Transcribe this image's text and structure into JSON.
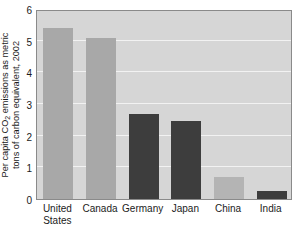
{
  "chart_data": {
    "type": "bar",
    "title": "",
    "xlabel": "",
    "ylabel_line1": "Per capita CO",
    "ylabel_sub": "2",
    "ylabel_line1b": " emissions as metric",
    "ylabel_line2": "tons of carbon equivalent, 2002",
    "categories": [
      "United States",
      "Canada",
      "Germany",
      "Japan",
      "China",
      "India"
    ],
    "category_lines": [
      [
        "United",
        "States"
      ],
      [
        "Canada"
      ],
      [
        "Germany"
      ],
      [
        "Japan"
      ],
      [
        "China"
      ],
      [
        "India"
      ]
    ],
    "values": [
      5.4,
      5.1,
      2.7,
      2.45,
      0.7,
      0.25
    ],
    "bar_colors": [
      "#a8a8a8",
      "#a8a8a8",
      "#3d3d3d",
      "#3d3d3d",
      "#b4b4b4",
      "#3d3d3d"
    ],
    "ylim": [
      0,
      6
    ],
    "ytick_labels": [
      "0",
      "1",
      "2",
      "3",
      "4",
      "5",
      "6"
    ],
    "ytick_values": [
      0,
      1,
      2,
      3,
      4,
      5,
      6
    ],
    "grid": true,
    "gridline_color": "#f2f2f2",
    "plot_background": "#d6d6d6",
    "legend": "none"
  }
}
